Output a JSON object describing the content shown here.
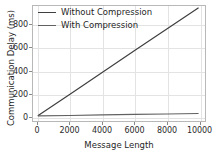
{
  "chart_data": {
    "type": "line",
    "title": "",
    "xlabel": "Message Length",
    "ylabel": "Communication Delay (ms)",
    "xlim": [
      -300,
      10400
    ],
    "ylim": [
      -40,
      960
    ],
    "xticks": [
      0,
      2000,
      4000,
      6000,
      8000,
      10000
    ],
    "xtick_labels": [
      "0",
      "2000",
      "4000",
      "6000",
      "8000",
      "10000"
    ],
    "yticks": [
      0,
      200,
      400,
      600,
      800
    ],
    "ytick_labels": [
      "0",
      "200",
      "400",
      "600",
      "800"
    ],
    "grid": true,
    "legend_position": "upper left",
    "x": [
      0,
      2000,
      4000,
      6000,
      8000,
      10000
    ],
    "series": [
      {
        "name": "Without Compression",
        "color": "#3f3f3f",
        "values": [
          5,
          193,
          382,
          570,
          758,
          945
        ]
      },
      {
        "name": "With Compression",
        "color": "#616161",
        "values": [
          4,
          8,
          13,
          17,
          21,
          25
        ]
      }
    ]
  },
  "legend": {
    "items": [
      {
        "label": "Without Compression"
      },
      {
        "label": "With Compression"
      }
    ]
  },
  "colors": {
    "without_compression": "#3f3f3f",
    "with_compression": "#616161",
    "gridline": "#e3e3e3",
    "spine": "#b8b8b8",
    "text": "#1f1f1f",
    "background": "#ffffff"
  }
}
